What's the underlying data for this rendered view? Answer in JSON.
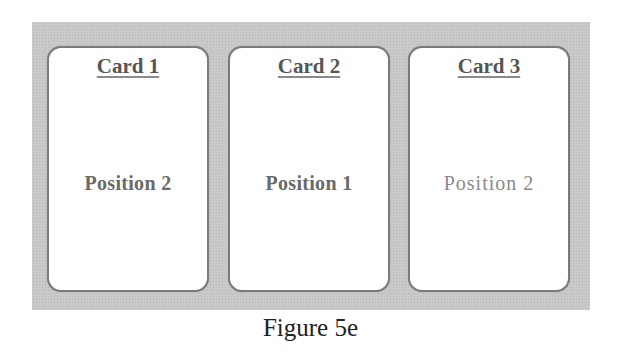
{
  "figure": {
    "caption": "Figure 5e",
    "panel_color": "#c9c9c9",
    "cards": [
      {
        "title": "Card 1",
        "position": "Position 2"
      },
      {
        "title": "Card 2",
        "position": "Position 1"
      },
      {
        "title": "Card 3",
        "position": "Position 2"
      }
    ]
  }
}
